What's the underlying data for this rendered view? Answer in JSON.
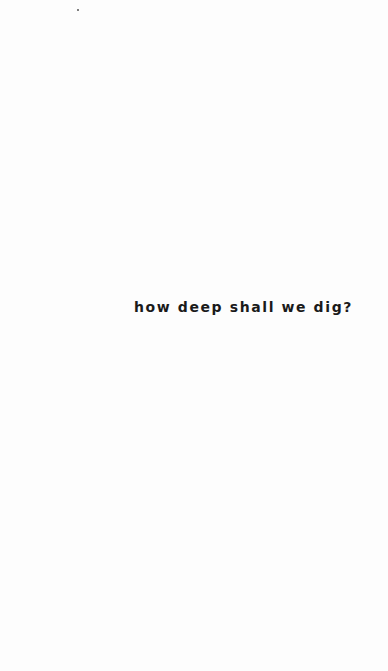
{
  "page": {
    "headline": "how deep shall we dig?"
  }
}
